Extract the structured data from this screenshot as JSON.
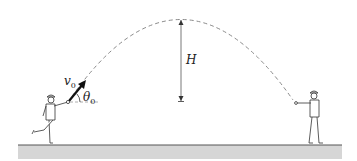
{
  "figure": {
    "labels": {
      "initial_velocity": "v",
      "initial_velocity_sub": "0",
      "launch_angle": "θ",
      "launch_angle_sub": "0",
      "max_height": "H"
    },
    "colors": {
      "trajectory": "#8a8a8a",
      "ground": "#d4d4d4",
      "ground_edge": "#555555",
      "figure_line": "#333333",
      "arrow": "#111111"
    }
  }
}
